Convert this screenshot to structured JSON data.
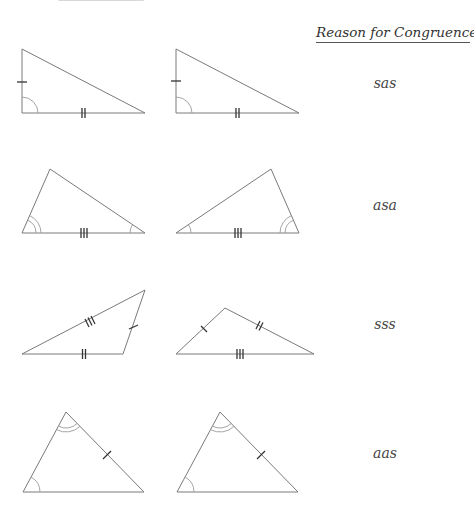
{
  "header": {
    "title": "Reason for Congruence"
  },
  "rows": [
    {
      "reason": "sas"
    },
    {
      "reason": "asa"
    },
    {
      "reason": "sss"
    },
    {
      "reason": "aas"
    }
  ],
  "colors": {
    "stroke": "#7a7a7a",
    "text": "#444444",
    "background": "#ffffff"
  }
}
